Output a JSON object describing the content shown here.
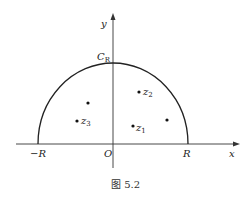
{
  "figure": {
    "caption": "图 5.2",
    "axes": {
      "x_label": "x",
      "y_label": "y",
      "origin_label": "O"
    },
    "ticks": {
      "neg_R": "−R",
      "pos_R": "R"
    },
    "contour_label": {
      "main": "C",
      "sub": "R"
    },
    "points": [
      {
        "name": "z",
        "sub": "3"
      },
      {
        "name": "z",
        "sub": "1"
      },
      {
        "name": "z",
        "sub": "2"
      }
    ]
  }
}
